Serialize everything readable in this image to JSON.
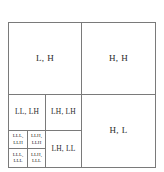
{
  "diagram": {
    "type": "wavelet-subband-decomposition",
    "background_color": "#ffffff",
    "line_color": "#7a7a7a",
    "text_color": "#2b2b2b",
    "levels": 3
  },
  "subbands": {
    "level1": {
      "lh": "L, H",
      "hh": "H, H",
      "hl": "H, L"
    },
    "level2": {
      "ll_lh": "LL, LH",
      "lh_lh": "LH, LH",
      "lh_ll": "LH, LL"
    },
    "level3": {
      "top_left": {
        "line1": "LLL,",
        "line2": "LLH"
      },
      "top_right": {
        "line1": "LLH,",
        "line2": "LLH"
      },
      "bottom_left": {
        "line1": "LLL,",
        "line2": "LLL"
      },
      "bottom_right": {
        "line1": "LLH,",
        "line2": "LLL"
      }
    }
  }
}
